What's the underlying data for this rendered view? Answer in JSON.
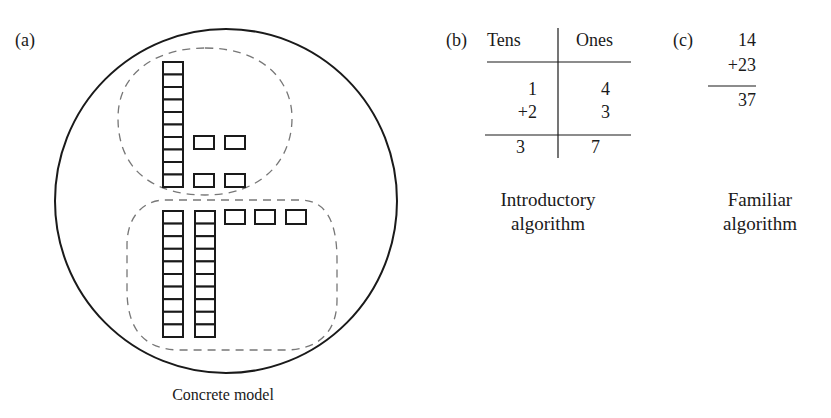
{
  "panels": {
    "a": {
      "label": "(a)",
      "caption": "Concrete model",
      "model": {
        "top_group": {
          "tens_rods": 1,
          "ones_units": 4
        },
        "bottom_group": {
          "tens_rods": 2,
          "ones_units": 3
        }
      }
    },
    "b": {
      "label": "(b)",
      "headers": {
        "tens": "Tens",
        "ones": "Ones"
      },
      "rows": [
        {
          "tens": "1",
          "ones": "4"
        },
        {
          "tens": "+2",
          "ones": "3"
        }
      ],
      "result": {
        "tens": "3",
        "ones": "7"
      },
      "caption_line1": "Introductory",
      "caption_line2": "algorithm"
    },
    "c": {
      "label": "(c)",
      "addend1": "14",
      "addend2": "+23",
      "sum": "37",
      "caption_line1": "Familiar",
      "caption_line2": "algorithm"
    }
  },
  "colors": {
    "ink": "#1a1a1a",
    "dashed": "#777777"
  }
}
